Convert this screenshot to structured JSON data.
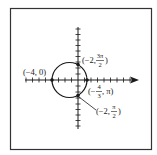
{
  "figure": {
    "type": "polar-graph",
    "frame_color": "#333333",
    "curve_color": "#1a1a1a"
  },
  "axes": {
    "horizontal": {
      "has_arrow": true,
      "tick_count_left": 8,
      "tick_count_right": 9
    },
    "vertical": {
      "has_arrow": false,
      "tick_count_up": 9,
      "tick_count_down": 9
    }
  },
  "curve": {
    "shape": "circle",
    "description": "Circle passing through the polar points labeled"
  },
  "points": [
    {
      "id": "left",
      "label": "(−4, 0)",
      "r": "−4",
      "theta": "0"
    },
    {
      "id": "top",
      "label_r": "(−2, ",
      "label_num": "3π",
      "label_den": "2",
      "label_close": ")",
      "r": "−2",
      "theta": "3π/2"
    },
    {
      "id": "right",
      "label_r": "(−",
      "label_num": "4",
      "label_den": "3",
      "label_tail": ", π)",
      "r": "−4/3",
      "theta": "π"
    },
    {
      "id": "bottom",
      "label_r": "(−2, ",
      "label_num": "π",
      "label_den": "2",
      "label_close": ")",
      "r": "−2",
      "theta": "π/2"
    }
  ]
}
